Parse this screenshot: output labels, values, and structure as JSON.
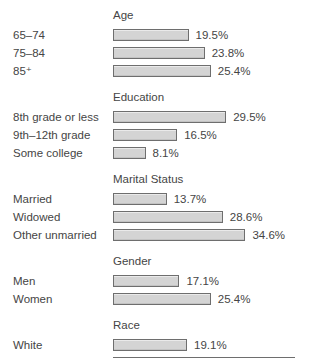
{
  "chart_data": {
    "type": "bar",
    "orientation": "horizontal",
    "value_unit": "%",
    "value_suffix": "%",
    "xlim": [
      0,
      50
    ],
    "px_per_percent": 3.77,
    "grid": false,
    "legend": false,
    "bar_fill_color": "#d4d4d4",
    "bar_border_color": "#6e6e6e",
    "text_color": "#454545",
    "groups": [
      {
        "title": "Age",
        "items": [
          {
            "label": "65–74",
            "value": 19.5,
            "value_label": "19.5%"
          },
          {
            "label": "75–84",
            "value": 23.8,
            "value_label": "23.8%"
          },
          {
            "label": "85⁺",
            "value": 25.4,
            "value_label": "25.4%"
          }
        ]
      },
      {
        "title": "Education",
        "items": [
          {
            "label": "8th grade or less",
            "value": 29.5,
            "value_label": "29.5%"
          },
          {
            "label": "9th–12th grade",
            "value": 16.5,
            "value_label": "16.5%"
          },
          {
            "label": "Some college",
            "value": 8.1,
            "value_label": "8.1%"
          }
        ]
      },
      {
        "title": "Marital Status",
        "items": [
          {
            "label": "Married",
            "value": 13.7,
            "value_label": "13.7%"
          },
          {
            "label": "Widowed",
            "value": 28.6,
            "value_label": "28.6%"
          },
          {
            "label": "Other unmarried",
            "value": 34.6,
            "value_label": "34.6%"
          }
        ]
      },
      {
        "title": "Gender",
        "items": [
          {
            "label": "Men",
            "value": 17.1,
            "value_label": "17.1%"
          },
          {
            "label": "Women",
            "value": 25.4,
            "value_label": "25.4%"
          }
        ]
      },
      {
        "title": "Race",
        "items": [
          {
            "label": "White",
            "value": 19.1,
            "value_label": "19.1%"
          },
          {
            "label": "Black and Hispanic",
            "value": 47.7,
            "value_label": "47.7%"
          }
        ]
      }
    ]
  }
}
